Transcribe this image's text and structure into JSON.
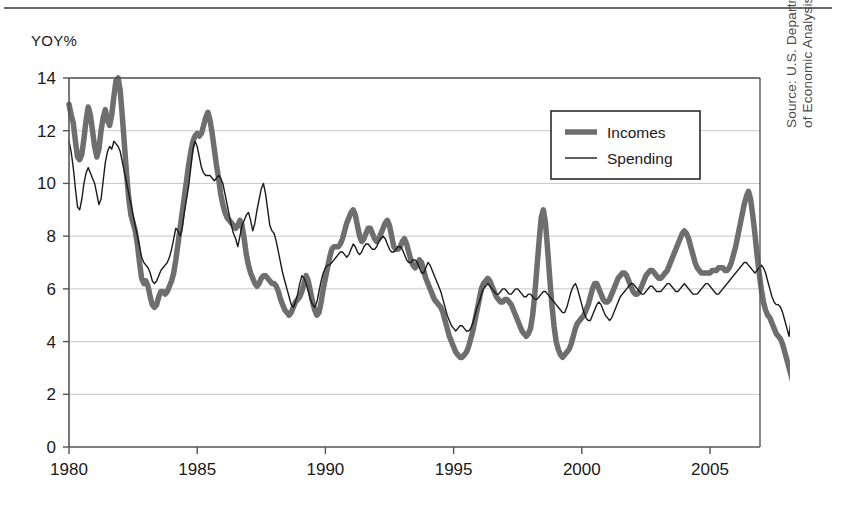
{
  "figure": {
    "y_axis_title": "YOY%",
    "source_note": "Source: U.S. Department of Commerce, Bureau\nof Economic Analysis"
  },
  "chart_data": {
    "type": "line",
    "title": "",
    "subtitle": "",
    "xlabel": "",
    "ylabel": "YOY%",
    "xlim": [
      1980.0,
      2006.95
    ],
    "ylim": [
      0,
      14
    ],
    "y_ticks": [
      0,
      2,
      4,
      6,
      8,
      10,
      12,
      14
    ],
    "y_tick_labels": [
      "0",
      "2",
      "4",
      "6",
      "8",
      "10",
      "12",
      "14"
    ],
    "x_ticks": [
      1980,
      1985,
      1990,
      1995,
      2000,
      2005
    ],
    "x_tick_labels": [
      "1980",
      "1985",
      "1990",
      "1995",
      "2000",
      "2005"
    ],
    "grid": "horizontal",
    "grid_color": "#c8c8c8",
    "axis_color": "#555555",
    "legend": {
      "position": "top-right-inside",
      "entries": [
        {
          "name": "Incomes",
          "color": "#6e6e6e",
          "width": 5.5
        },
        {
          "name": "Spending",
          "color": "#1a1a1a",
          "width": 1.4
        }
      ]
    },
    "x_start": 1980.0,
    "x_step": 0.0833333,
    "series": [
      {
        "name": "Incomes",
        "color": "#6e6e6e",
        "line_width": 5.5,
        "values": [
          13.0,
          12.6,
          12.3,
          11.6,
          11.0,
          10.9,
          11.1,
          11.7,
          12.4,
          12.9,
          12.6,
          12.0,
          11.4,
          11.0,
          11.3,
          12.0,
          12.5,
          12.8,
          12.4,
          12.2,
          12.6,
          13.3,
          13.9,
          14.0,
          13.5,
          12.5,
          11.4,
          10.3,
          9.4,
          8.8,
          8.5,
          8.2,
          7.7,
          7.0,
          6.4,
          6.2,
          6.3,
          6.1,
          5.7,
          5.4,
          5.3,
          5.4,
          5.7,
          5.9,
          5.9,
          5.8,
          5.9,
          6.1,
          6.3,
          6.6,
          7.1,
          7.7,
          8.3,
          8.9,
          9.5,
          10.1,
          10.7,
          11.2,
          11.6,
          11.8,
          11.9,
          11.8,
          11.9,
          12.2,
          12.5,
          12.7,
          12.4,
          11.9,
          11.3,
          10.7,
          10.2,
          9.6,
          9.2,
          8.9,
          8.7,
          8.6,
          8.5,
          8.4,
          8.3,
          8.4,
          8.6,
          8.4,
          7.9,
          7.3,
          6.9,
          6.6,
          6.4,
          6.2,
          6.1,
          6.2,
          6.4,
          6.5,
          6.5,
          6.4,
          6.3,
          6.2,
          6.2,
          6.1,
          5.9,
          5.6,
          5.4,
          5.2,
          5.1,
          5.0,
          5.1,
          5.3,
          5.5,
          5.6,
          5.7,
          5.9,
          6.2,
          6.5,
          6.3,
          5.9,
          5.5,
          5.2,
          5.0,
          5.1,
          5.5,
          6.0,
          6.4,
          6.8,
          7.2,
          7.5,
          7.6,
          7.6,
          7.6,
          7.7,
          7.9,
          8.2,
          8.5,
          8.7,
          8.9,
          9.0,
          8.8,
          8.4,
          8.0,
          7.8,
          7.9,
          8.1,
          8.3,
          8.3,
          8.1,
          7.9,
          7.8,
          7.9,
          8.1,
          8.3,
          8.5,
          8.6,
          8.4,
          8.0,
          7.6,
          7.5,
          7.5,
          7.6,
          7.8,
          7.9,
          7.7,
          7.4,
          7.1,
          6.9,
          6.8,
          6.9,
          7.1,
          7.0,
          6.7,
          6.4,
          6.2,
          6.0,
          5.8,
          5.6,
          5.5,
          5.4,
          5.3,
          5.1,
          4.8,
          4.5,
          4.2,
          4.0,
          3.8,
          3.6,
          3.5,
          3.4,
          3.4,
          3.5,
          3.6,
          3.8,
          4.1,
          4.4,
          4.8,
          5.2,
          5.6,
          6.0,
          6.2,
          6.3,
          6.4,
          6.3,
          6.1,
          5.9,
          5.7,
          5.6,
          5.5,
          5.5,
          5.6,
          5.6,
          5.5,
          5.4,
          5.2,
          5.0,
          4.8,
          4.6,
          4.4,
          4.3,
          4.2,
          4.3,
          4.5,
          5.0,
          5.8,
          6.8,
          7.8,
          8.7,
          9.0,
          8.5,
          7.5,
          6.4,
          5.4,
          4.6,
          4.0,
          3.7,
          3.5,
          3.4,
          3.5,
          3.6,
          3.7,
          3.9,
          4.2,
          4.5,
          4.7,
          4.8,
          4.9,
          5.0,
          5.2,
          5.4,
          5.7,
          6.0,
          6.2,
          6.2,
          6.0,
          5.8,
          5.6,
          5.5,
          5.5,
          5.6,
          5.8,
          6.0,
          6.2,
          6.4,
          6.5,
          6.6,
          6.6,
          6.5,
          6.3,
          6.1,
          5.9,
          5.8,
          5.8,
          5.9,
          6.1,
          6.3,
          6.5,
          6.6,
          6.7,
          6.7,
          6.6,
          6.5,
          6.4,
          6.4,
          6.5,
          6.6,
          6.7,
          6.9,
          7.1,
          7.3,
          7.5,
          7.7,
          7.9,
          8.1,
          8.2,
          8.1,
          7.9,
          7.6,
          7.3,
          7.0,
          6.8,
          6.7,
          6.6,
          6.6,
          6.6,
          6.6,
          6.6,
          6.7,
          6.7,
          6.7,
          6.8,
          6.8,
          6.8,
          6.7,
          6.7,
          6.8,
          7.0,
          7.3,
          7.6,
          8.0,
          8.4,
          8.8,
          9.2,
          9.5,
          9.7,
          9.4,
          8.8,
          8.1,
          7.3,
          6.6,
          6.0,
          5.5,
          5.2,
          5.0,
          4.9,
          4.7,
          4.5,
          4.3,
          4.2,
          4.1,
          3.9,
          3.6,
          3.3,
          3.0,
          2.7,
          2.4,
          2.1,
          1.9,
          1.7,
          1.6,
          1.7,
          1.9,
          2.1,
          2.2,
          2.2,
          2.2,
          2.2,
          2.2,
          2.2,
          2.3,
          2.3,
          2.2,
          2.1,
          2.1,
          2.2,
          2.4,
          2.4,
          2.5,
          2.7,
          3.1,
          3.6,
          4.2,
          4.7,
          5.1,
          5.4,
          5.6,
          5.8,
          6.0,
          6.2,
          6.3,
          6.3,
          6.2,
          6.1,
          6.1,
          6.2,
          6.5,
          9.4,
          6.4,
          5.5,
          5.0,
          5.0,
          5.2,
          5.6,
          6.0,
          6.3,
          5.9,
          5.0,
          4.0,
          3.5,
          4.2,
          5.4,
          6.3,
          8.5,
          7.0,
          6.0,
          5.6,
          5.5,
          5.7,
          6.0,
          6.0,
          5.8,
          5.6,
          5.7,
          5.9
        ]
      },
      {
        "name": "Spending",
        "color": "#1a1a1a",
        "line_width": 1.4,
        "values": [
          11.6,
          11.2,
          10.6,
          9.8,
          9.1,
          9.0,
          9.4,
          10.0,
          10.4,
          10.6,
          10.4,
          10.2,
          10.0,
          9.6,
          9.2,
          9.4,
          10.1,
          10.8,
          11.2,
          11.4,
          11.3,
          11.6,
          11.5,
          11.4,
          11.2,
          10.8,
          10.4,
          10.0,
          9.6,
          9.2,
          8.8,
          8.4,
          8.0,
          7.6,
          7.2,
          7.0,
          6.9,
          6.8,
          6.6,
          6.3,
          6.2,
          6.3,
          6.5,
          6.7,
          6.8,
          6.9,
          7.0,
          7.2,
          7.5,
          7.9,
          8.3,
          8.2,
          8.0,
          8.3,
          8.9,
          9.4,
          9.9,
          10.6,
          11.3,
          11.6,
          11.4,
          11.0,
          10.6,
          10.4,
          10.3,
          10.3,
          10.3,
          10.2,
          10.1,
          10.2,
          10.3,
          10.2,
          10.0,
          9.6,
          9.2,
          8.8,
          8.4,
          8.1,
          7.9,
          7.6,
          8.0,
          8.4,
          8.6,
          8.8,
          8.9,
          8.6,
          8.2,
          8.5,
          9.0,
          9.4,
          9.8,
          10.0,
          9.6,
          9.0,
          8.4,
          8.2,
          8.1,
          7.8,
          7.4,
          7.0,
          6.6,
          6.3,
          6.0,
          5.7,
          5.4,
          5.3,
          5.5,
          5.8,
          6.2,
          6.5,
          6.4,
          6.2,
          5.9,
          5.6,
          5.4,
          5.3,
          5.5,
          5.9,
          6.3,
          6.6,
          6.8,
          6.9,
          6.9,
          7.0,
          7.1,
          7.2,
          7.3,
          7.4,
          7.4,
          7.3,
          7.2,
          7.3,
          7.5,
          7.7,
          7.6,
          7.4,
          7.3,
          7.4,
          7.6,
          7.7,
          7.7,
          7.6,
          7.5,
          7.5,
          7.6,
          7.8,
          7.9,
          8.0,
          7.9,
          7.7,
          7.5,
          7.4,
          7.4,
          7.5,
          7.6,
          7.6,
          7.5,
          7.3,
          7.1,
          7.0,
          7.0,
          7.1,
          7.1,
          7.0,
          6.8,
          6.6,
          6.6,
          6.8,
          7.0,
          6.9,
          6.7,
          6.5,
          6.3,
          6.1,
          5.9,
          5.6,
          5.3,
          5.0,
          4.8,
          4.6,
          4.5,
          4.4,
          4.5,
          4.6,
          4.6,
          4.5,
          4.4,
          4.4,
          4.5,
          4.7,
          5.0,
          5.3,
          5.5,
          5.8,
          6.0,
          6.1,
          6.2,
          6.1,
          6.0,
          5.9,
          5.8,
          5.8,
          5.9,
          6.0,
          6.0,
          5.9,
          5.8,
          5.8,
          5.9,
          6.0,
          6.0,
          5.9,
          5.8,
          5.7,
          5.7,
          5.8,
          5.8,
          5.7,
          5.6,
          5.6,
          5.7,
          5.8,
          5.9,
          5.9,
          5.8,
          5.7,
          5.6,
          5.5,
          5.4,
          5.3,
          5.2,
          5.1,
          5.1,
          5.3,
          5.6,
          5.9,
          6.1,
          6.2,
          6.0,
          5.7,
          5.4,
          5.1,
          4.9,
          4.8,
          4.8,
          5.0,
          5.2,
          5.4,
          5.5,
          5.4,
          5.2,
          5.0,
          4.9,
          4.8,
          4.9,
          5.1,
          5.3,
          5.5,
          5.7,
          5.8,
          5.9,
          6.0,
          6.1,
          6.2,
          6.2,
          6.1,
          6.0,
          5.9,
          5.8,
          5.8,
          5.9,
          6.0,
          6.1,
          6.1,
          6.0,
          5.9,
          5.9,
          5.9,
          6.0,
          6.1,
          6.2,
          6.2,
          6.1,
          6.0,
          5.9,
          5.9,
          6.0,
          6.1,
          6.2,
          6.1,
          6.0,
          5.9,
          5.8,
          5.8,
          5.8,
          5.9,
          6.0,
          6.1,
          6.2,
          6.2,
          6.1,
          6.0,
          5.9,
          5.8,
          5.8,
          5.9,
          6.0,
          6.1,
          6.2,
          6.3,
          6.4,
          6.5,
          6.6,
          6.7,
          6.8,
          6.9,
          7.0,
          7.0,
          6.9,
          6.8,
          6.7,
          6.6,
          6.7,
          6.8,
          6.9,
          6.8,
          6.6,
          6.3,
          6.0,
          5.7,
          5.5,
          5.4,
          5.4,
          5.3,
          5.1,
          4.8,
          4.5,
          4.2,
          4.9,
          4.3,
          5.5,
          4.6,
          5.0,
          4.2,
          4.6,
          4.0,
          4.8,
          4.2,
          4.7,
          4.0,
          4.8,
          4.2,
          5.0,
          4.3,
          4.6,
          3.9,
          4.6,
          4.1,
          4.8,
          4.3,
          4.6,
          4.4,
          4.7,
          5.0,
          5.4,
          5.7,
          6.0,
          6.2,
          6.3,
          6.2,
          6.1,
          6.2,
          6.4,
          6.7,
          7.0,
          6.6,
          6.2,
          6.0,
          5.9,
          6.0,
          6.3,
          6.6,
          6.4,
          6.1,
          5.9,
          6.0,
          6.3,
          6.7,
          7.0,
          6.6,
          6.2,
          6.0,
          6.2,
          6.6,
          7.2,
          6.8,
          6.3,
          5.9,
          5.7,
          5.6,
          5.6,
          5.7,
          5.9,
          6.0,
          5.9,
          5.7,
          5.6,
          5.8
        ]
      }
    ]
  }
}
